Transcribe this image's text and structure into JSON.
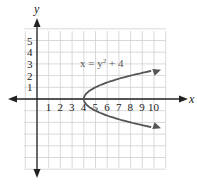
{
  "chart_data": {
    "type": "line",
    "title": "",
    "equation": "x = y² + 4",
    "xlabel": "x",
    "ylabel": "y",
    "x_ticks": [
      "1",
      "2",
      "3",
      "4",
      "5",
      "6",
      "7",
      "8",
      "9",
      "10"
    ],
    "y_ticks": [
      "1",
      "2",
      "3",
      "4",
      "5"
    ],
    "xlim": [
      -1,
      11
    ],
    "ylim": [
      -6,
      6
    ],
    "grid": true,
    "series": [
      {
        "name": "x = y^2 + 4",
        "points": [
          [
            10.3,
            2.5
          ],
          [
            8,
            1.94
          ],
          [
            6.25,
            1.5
          ],
          [
            5,
            1
          ],
          [
            4.25,
            0.5
          ],
          [
            4,
            0
          ],
          [
            4.25,
            -0.5
          ],
          [
            5,
            -1
          ],
          [
            6.25,
            -1.5
          ],
          [
            8,
            -1.94
          ],
          [
            10.3,
            -2.5
          ]
        ]
      }
    ],
    "color": "#555555"
  },
  "labels": {
    "x_axis": "x",
    "y_axis": "y",
    "equation_main": "x = y",
    "equation_exp": "2",
    "equation_tail": " + 4",
    "x_ticks": [
      "1",
      "2",
      "3",
      "4",
      "5",
      "6",
      "7",
      "8",
      "9",
      "10"
    ],
    "y_ticks": [
      "1",
      "2",
      "3",
      "4",
      "5"
    ]
  }
}
